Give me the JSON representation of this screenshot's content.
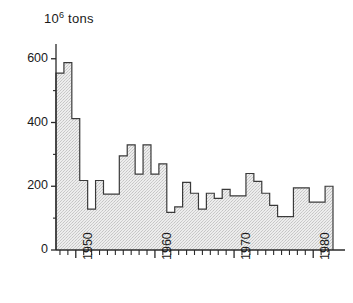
{
  "chart_data": {
    "type": "bar",
    "title": "",
    "subtitle": "",
    "xlabel": "",
    "ylabel": "10^6 tons",
    "ylabel_mantissa": "10",
    "ylabel_exponent": "6",
    "ylabel_unit": "tons",
    "xlim": [
      1947.5,
      1982.5
    ],
    "ylim": [
      0,
      640
    ],
    "grid": false,
    "legend": null,
    "annotations": [],
    "y_ticks_major": [
      0,
      200,
      400,
      600
    ],
    "y_tick_labels": [
      "0",
      "200",
      "400",
      "600"
    ],
    "y_ticks_minor": [
      100,
      300,
      500
    ],
    "x_ticks_major": [
      1950,
      1960,
      1970,
      1980
    ],
    "x_tick_labels": [
      "1950",
      "1960",
      "1970",
      "1980"
    ],
    "x_ticks_minor_step": 1,
    "categories": [
      1948,
      1949,
      1950,
      1951,
      1952,
      1953,
      1954,
      1955,
      1956,
      1957,
      1958,
      1959,
      1960,
      1961,
      1962,
      1963,
      1964,
      1965,
      1966,
      1967,
      1968,
      1969,
      1970,
      1971,
      1972,
      1973,
      1974,
      1975,
      1976,
      1977,
      1978,
      1979,
      1980,
      1981,
      1982
    ],
    "values": [
      555,
      588,
      412,
      218,
      128,
      218,
      175,
      175,
      295,
      330,
      238,
      330,
      238,
      270,
      118,
      135,
      212,
      178,
      128,
      178,
      162,
      190,
      170,
      170,
      240,
      215,
      178,
      140,
      105,
      105,
      195,
      195,
      150,
      150,
      200
    ],
    "series_name": "annual tonnage",
    "fill_color": "#e3e3e3",
    "line_color": "#3a3a3a",
    "axis_color": "#2a2a2a",
    "background_color": "#ffffff"
  },
  "axes": {
    "y_axis_name": "tonnage-axis",
    "x_axis_name": "year-axis"
  }
}
